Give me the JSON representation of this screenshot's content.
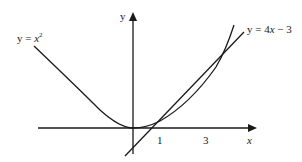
{
  "diagram": {
    "type": "function-graph",
    "axes": {
      "x_label": "x",
      "y_label": "y"
    },
    "x_ticks": [
      "1",
      "3"
    ],
    "curves": [
      {
        "name": "parabola",
        "label_prefix": "y = ",
        "label_var": "x",
        "label_exp": "2",
        "equation": "y = x^2"
      },
      {
        "name": "tangent-line",
        "label_prefix": "y = 4",
        "label_var": "x",
        "label_suffix": " − 3",
        "equation": "y = 4x - 3"
      }
    ],
    "intersections": [
      {
        "x": 1,
        "y": 1
      },
      {
        "x": 3,
        "y": 9
      }
    ],
    "colors": {
      "stroke": "#1a1a1a",
      "background": "#ffffff"
    }
  }
}
